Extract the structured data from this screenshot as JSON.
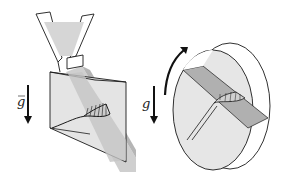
{
  "figure": {
    "left_panel": {
      "name": "hopper-chute-flow",
      "gravity_label": "g",
      "gravity_has_vector_arrow": true
    },
    "right_panel": {
      "name": "rotating-drum-flow",
      "gravity_label": "g",
      "gravity_has_vector_arrow": false,
      "rotation_arrow": "counterclockwise"
    },
    "colors": {
      "outline": "#1a1a1a",
      "flow_light": "#d9d9d9",
      "flow_mid": "#bdbdbd",
      "flow_dark": "#a8a8a8",
      "background": "#ffffff"
    }
  }
}
